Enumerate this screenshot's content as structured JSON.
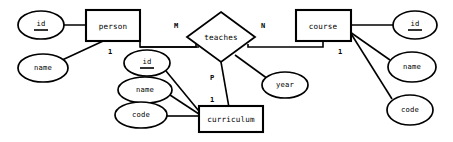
{
  "diagram": {
    "type": "er-diagram",
    "entities": [
      {
        "id": "person",
        "label": "person",
        "x": 113,
        "y": 25,
        "w": 54,
        "h": 31,
        "attributes": [
          {
            "id": "person-id",
            "label": "id",
            "key": true,
            "cx": 41,
            "cy": 25,
            "rx": 23,
            "ry": 14
          },
          {
            "id": "person-name",
            "label": "name",
            "key": false,
            "cx": 43,
            "cy": 68,
            "rx": 25,
            "ry": 14
          }
        ]
      },
      {
        "id": "course",
        "label": "course",
        "x": 323,
        "y": 25,
        "w": 55,
        "h": 31,
        "attributes": [
          {
            "id": "course-id",
            "label": "id",
            "key": true,
            "cx": 415,
            "cy": 25,
            "rx": 22,
            "ry": 14
          },
          {
            "id": "course-name",
            "label": "name",
            "key": false,
            "cx": 412,
            "cy": 67,
            "rx": 24,
            "ry": 15
          },
          {
            "id": "course-code",
            "label": "code",
            "key": false,
            "cx": 410,
            "cy": 110,
            "rx": 23,
            "ry": 15
          }
        ]
      },
      {
        "id": "curriculum",
        "label": "curriculum",
        "x": 231,
        "y": 119,
        "w": 64,
        "h": 26,
        "attributes": [
          {
            "id": "curriculum-id",
            "label": "id",
            "key": true,
            "cx": 147,
            "cy": 63,
            "rx": 23,
            "ry": 13
          },
          {
            "id": "curriculum-name",
            "label": "name",
            "key": false,
            "cx": 145,
            "cy": 90,
            "rx": 27,
            "ry": 13
          },
          {
            "id": "curriculum-code",
            "label": "code",
            "key": false,
            "cx": 141,
            "cy": 115,
            "rx": 26,
            "ry": 13
          }
        ]
      }
    ],
    "relationships": [
      {
        "id": "teaches",
        "label": "teaches",
        "cx": 221,
        "cy": 37,
        "rx": 34,
        "ry": 25,
        "attributes": [
          {
            "id": "teaches-year",
            "label": "year",
            "key": false,
            "cx": 285,
            "cy": 85,
            "rx": 23,
            "ry": 13
          }
        ],
        "cardinalities": [
          {
            "id": "card-person-m",
            "label": "M",
            "x": 176,
            "y": 26,
            "connects": "person"
          },
          {
            "id": "card-course-n",
            "label": "N",
            "x": 263,
            "y": 26,
            "connects": "course"
          },
          {
            "id": "card-curriculum-p",
            "label": "P",
            "x": 212,
            "y": 78,
            "connects": "curriculum"
          }
        ]
      }
    ],
    "participation_labels": [
      {
        "id": "person-one",
        "label": "1",
        "x": 110,
        "y": 47
      },
      {
        "id": "course-one",
        "label": "1",
        "x": 340,
        "y": 47
      },
      {
        "id": "curriculum-one",
        "label": "1",
        "x": 212,
        "y": 100
      }
    ],
    "colors": {
      "stroke": "#000000",
      "fill": "#ffffff",
      "background": "#ffffff"
    }
  }
}
